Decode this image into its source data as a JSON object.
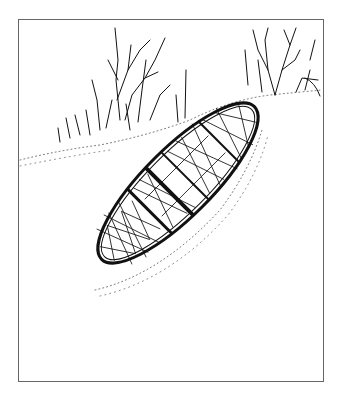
{
  "illustration": {
    "subject": "snowshoe lying on snowy slope with bare shrubs",
    "style": "black ink line drawing",
    "colors": {
      "ink": "#111111",
      "background": "#ffffff",
      "frame": "#666666"
    }
  }
}
